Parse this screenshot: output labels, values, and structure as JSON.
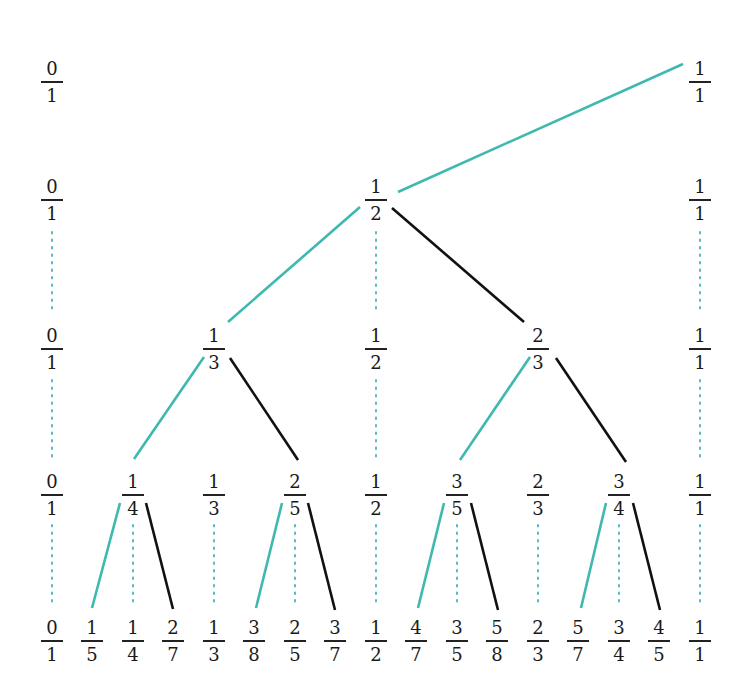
{
  "colors": {
    "left_edge": "#3fb8b0",
    "right_edge": "#111111",
    "dotted_link": "#5cb8c4",
    "text": "#1a1a1a"
  },
  "levels": [
    {
      "y": 60,
      "nodes": [
        {
          "num": "0",
          "den": "1",
          "x": 52
        },
        {
          "num": "1",
          "den": "1",
          "x": 700
        }
      ]
    },
    {
      "y": 178,
      "nodes": [
        {
          "num": "0",
          "den": "1",
          "x": 52
        },
        {
          "num": "1",
          "den": "2",
          "x": 376
        },
        {
          "num": "1",
          "den": "1",
          "x": 700
        }
      ]
    },
    {
      "y": 327,
      "nodes": [
        {
          "num": "0",
          "den": "1",
          "x": 52
        },
        {
          "num": "1",
          "den": "3",
          "x": 214
        },
        {
          "num": "1",
          "den": "2",
          "x": 376
        },
        {
          "num": "2",
          "den": "3",
          "x": 538
        },
        {
          "num": "1",
          "den": "1",
          "x": 700
        }
      ]
    },
    {
      "y": 473,
      "nodes": [
        {
          "num": "0",
          "den": "1",
          "x": 52
        },
        {
          "num": "1",
          "den": "4",
          "x": 133
        },
        {
          "num": "1",
          "den": "3",
          "x": 214
        },
        {
          "num": "2",
          "den": "5",
          "x": 295
        },
        {
          "num": "1",
          "den": "2",
          "x": 376
        },
        {
          "num": "3",
          "den": "5",
          "x": 457
        },
        {
          "num": "2",
          "den": "3",
          "x": 538
        },
        {
          "num": "3",
          "den": "4",
          "x": 619
        },
        {
          "num": "1",
          "den": "1",
          "x": 700
        }
      ]
    },
    {
      "y": 619,
      "nodes": [
        {
          "num": "0",
          "den": "1",
          "x": 52
        },
        {
          "num": "1",
          "den": "5",
          "x": 92
        },
        {
          "num": "1",
          "den": "4",
          "x": 133
        },
        {
          "num": "2",
          "den": "7",
          "x": 173
        },
        {
          "num": "1",
          "den": "3",
          "x": 214
        },
        {
          "num": "3",
          "den": "8",
          "x": 254
        },
        {
          "num": "2",
          "den": "5",
          "x": 295
        },
        {
          "num": "3",
          "den": "7",
          "x": 335
        },
        {
          "num": "1",
          "den": "2",
          "x": 376
        },
        {
          "num": "4",
          "den": "7",
          "x": 416
        },
        {
          "num": "3",
          "den": "5",
          "x": 457
        },
        {
          "num": "5",
          "den": "8",
          "x": 497
        },
        {
          "num": "2",
          "den": "3",
          "x": 538
        },
        {
          "num": "5",
          "den": "7",
          "x": 578
        },
        {
          "num": "3",
          "den": "4",
          "x": 619
        },
        {
          "num": "4",
          "den": "5",
          "x": 659
        },
        {
          "num": "1",
          "den": "1",
          "x": 700
        }
      ]
    }
  ],
  "edges": [
    {
      "type": "left",
      "x1": 683,
      "y1": 64,
      "x2": 398,
      "y2": 192
    },
    {
      "type": "left",
      "x1": 360,
      "y1": 207,
      "x2": 228,
      "y2": 322
    },
    {
      "type": "right",
      "x1": 392,
      "y1": 208,
      "x2": 524,
      "y2": 322
    },
    {
      "type": "left",
      "x1": 204,
      "y1": 357,
      "x2": 134,
      "y2": 459
    },
    {
      "type": "right",
      "x1": 230,
      "y1": 358,
      "x2": 298,
      "y2": 460
    },
    {
      "type": "left",
      "x1": 530,
      "y1": 357,
      "x2": 460,
      "y2": 460
    },
    {
      "type": "right",
      "x1": 556,
      "y1": 358,
      "x2": 626,
      "y2": 462
    },
    {
      "type": "left",
      "x1": 120,
      "y1": 503,
      "x2": 92,
      "y2": 608
    },
    {
      "type": "right",
      "x1": 146,
      "y1": 503,
      "x2": 173,
      "y2": 609
    },
    {
      "type": "left",
      "x1": 282,
      "y1": 503,
      "x2": 256,
      "y2": 608
    },
    {
      "type": "right",
      "x1": 308,
      "y1": 503,
      "x2": 335,
      "y2": 610
    },
    {
      "type": "left",
      "x1": 444,
      "y1": 503,
      "x2": 418,
      "y2": 608
    },
    {
      "type": "right",
      "x1": 471,
      "y1": 503,
      "x2": 498,
      "y2": 610
    },
    {
      "type": "left",
      "x1": 606,
      "y1": 503,
      "x2": 581,
      "y2": 608
    },
    {
      "type": "right",
      "x1": 633,
      "y1": 503,
      "x2": 660,
      "y2": 610
    }
  ],
  "dotted_links": [
    {
      "x": 52,
      "y1": 232,
      "y2": 312
    },
    {
      "x": 376,
      "y1": 232,
      "y2": 312
    },
    {
      "x": 700,
      "y1": 232,
      "y2": 312
    },
    {
      "x": 52,
      "y1": 380,
      "y2": 460
    },
    {
      "x": 376,
      "y1": 380,
      "y2": 460
    },
    {
      "x": 700,
      "y1": 380,
      "y2": 460
    },
    {
      "x": 52,
      "y1": 525,
      "y2": 606
    },
    {
      "x": 133,
      "y1": 525,
      "y2": 606
    },
    {
      "x": 214,
      "y1": 525,
      "y2": 606
    },
    {
      "x": 295,
      "y1": 525,
      "y2": 606
    },
    {
      "x": 376,
      "y1": 525,
      "y2": 606
    },
    {
      "x": 457,
      "y1": 525,
      "y2": 606
    },
    {
      "x": 538,
      "y1": 525,
      "y2": 606
    },
    {
      "x": 619,
      "y1": 525,
      "y2": 606
    },
    {
      "x": 700,
      "y1": 525,
      "y2": 606
    }
  ]
}
